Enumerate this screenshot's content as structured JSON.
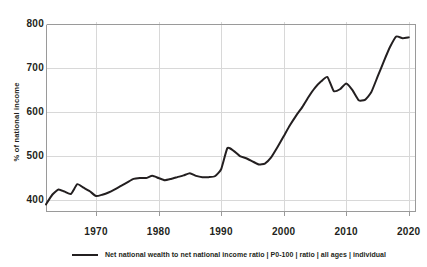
{
  "chart_data": {
    "type": "line",
    "title": "",
    "xlabel": "",
    "ylabel": "% of national income",
    "xlim": [
      1962,
      2021
    ],
    "ylim": [
      375,
      805
    ],
    "grid": true,
    "legend_position": "bottom-left",
    "y_ticks": [
      800,
      700,
      600,
      500,
      400
    ],
    "x_ticks": [
      1970,
      1980,
      1990,
      2000,
      2010,
      2020
    ],
    "series": [
      {
        "name": "Net national wealth to net national income ratio | P0-100 | ratio | all ages | individual",
        "color": "#231f20",
        "x": [
          1962,
          1963,
          1964,
          1965,
          1966,
          1967,
          1968,
          1969,
          1970,
          1971,
          1972,
          1973,
          1974,
          1975,
          1976,
          1977,
          1978,
          1979,
          1980,
          1981,
          1982,
          1983,
          1984,
          1985,
          1986,
          1987,
          1988,
          1989,
          1990,
          1991,
          1992,
          1993,
          1994,
          1995,
          1996,
          1997,
          1998,
          1999,
          2000,
          2001,
          2002,
          2003,
          2004,
          2005,
          2006,
          2007,
          2008,
          2009,
          2010,
          2011,
          2012,
          2013,
          2014,
          2015,
          2016,
          2017,
          2018,
          2019,
          2020
        ],
        "y": [
          390,
          412,
          424,
          419,
          414,
          436,
          428,
          420,
          409,
          412,
          417,
          424,
          432,
          440,
          448,
          450,
          450,
          455,
          450,
          445,
          448,
          452,
          456,
          461,
          455,
          452,
          452,
          454,
          470,
          518,
          512,
          500,
          495,
          488,
          481,
          483,
          497,
          520,
          545,
          570,
          592,
          612,
          635,
          655,
          670,
          680,
          648,
          652,
          665,
          650,
          627,
          628,
          645,
          680,
          715,
          748,
          772,
          768,
          770
        ]
      }
    ]
  },
  "legend": {
    "entries": [
      {
        "label": "Net national wealth to net national income ratio | P0-100 | ratio | all ages | individual",
        "swatch": "line-swatch",
        "color": "#231f20"
      }
    ]
  },
  "colors": {
    "line": "#231f20",
    "grid": "#d8d8d8",
    "axis": "#9a9a9a",
    "background": "#ffffff",
    "text": "#231f20"
  }
}
